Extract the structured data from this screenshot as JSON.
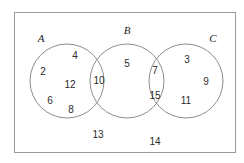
{
  "figure": {
    "name": "three-set-venn-diagram",
    "universe_border_color": "#9a9a9a",
    "circle_stroke_color": "#8d8d8d",
    "text_color": "#2b2b2b",
    "background_color": "#ffffff"
  },
  "sets": [
    {
      "id": "A",
      "label": "A",
      "label_x": 41,
      "label_y": 38,
      "cx": 67,
      "cy": 81,
      "r": 37
    },
    {
      "id": "B",
      "label": "B",
      "label_x": 127,
      "label_y": 30,
      "cx": 127,
      "cy": 81,
      "r": 37
    },
    {
      "id": "C",
      "label": "C",
      "label_x": 213,
      "label_y": 38,
      "cx": 186,
      "cy": 81,
      "r": 37
    }
  ],
  "regions": {
    "a_only": {
      "name": "A only",
      "values": [
        2,
        4,
        12,
        6,
        8
      ]
    },
    "a_and_b": {
      "name": "A intersect B",
      "values": [
        10
      ]
    },
    "b_only": {
      "name": "B only",
      "values": [
        5
      ]
    },
    "b_and_c": {
      "name": "B intersect C",
      "values": [
        7,
        15
      ]
    },
    "c_only": {
      "name": "C only",
      "values": [
        3,
        9,
        11
      ]
    },
    "outside": {
      "name": "Outside all sets",
      "values": [
        13,
        14
      ]
    }
  },
  "elements": [
    {
      "value": "4",
      "x": 75,
      "y": 56,
      "region": "a_only"
    },
    {
      "value": "2",
      "x": 43,
      "y": 72,
      "region": "a_only"
    },
    {
      "value": "12",
      "x": 70,
      "y": 85,
      "region": "a_only"
    },
    {
      "value": "6",
      "x": 50,
      "y": 101,
      "region": "a_only"
    },
    {
      "value": "8",
      "x": 71,
      "y": 110,
      "region": "a_only"
    },
    {
      "value": "10",
      "x": 99,
      "y": 81,
      "region": "a_and_b"
    },
    {
      "value": "5",
      "x": 127,
      "y": 64,
      "region": "b_only"
    },
    {
      "value": "7",
      "x": 155,
      "y": 71,
      "region": "b_and_c"
    },
    {
      "value": "15",
      "x": 155,
      "y": 96,
      "region": "b_and_c"
    },
    {
      "value": "3",
      "x": 187,
      "y": 60,
      "region": "c_only"
    },
    {
      "value": "9",
      "x": 206,
      "y": 82,
      "region": "c_only"
    },
    {
      "value": "11",
      "x": 186,
      "y": 101,
      "region": "c_only"
    },
    {
      "value": "13",
      "x": 98,
      "y": 135,
      "region": "outside"
    },
    {
      "value": "14",
      "x": 155,
      "y": 142,
      "region": "outside"
    }
  ]
}
